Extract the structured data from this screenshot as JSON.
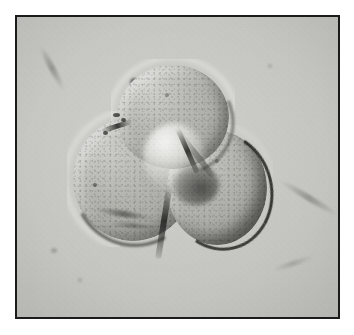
{
  "page": {
    "background_color": "#ffffff",
    "width": 354,
    "height": 335,
    "content_type": "photomicrograph"
  },
  "plate": {
    "frame_color": "#1b1b1b",
    "frame_width_px": 2,
    "left_px": 15,
    "top_px": 15,
    "width_px": 325,
    "height_px": 304,
    "field_background_color": "#c8c8c4"
  },
  "micrograph": {
    "modality": "differential-interference-contrast",
    "illumination_direction": "upper-left",
    "color_mode": "grayscale",
    "background_tone": "#c8c8c4",
    "specimen_label": "trilobate-foraminifera-test",
    "chambers": [
      {
        "id": "chamber-top",
        "name": "dorsal-chamber",
        "position": "top-center",
        "highlight_color": "#d2d2ce",
        "shadow_color": "#8e8e8a"
      },
      {
        "id": "chamber-left",
        "name": "ventral-chamber",
        "position": "left",
        "highlight_color": "#cdcdc9",
        "shadow_color": "#8d8d89"
      },
      {
        "id": "chamber-right",
        "name": "final-chamber",
        "position": "lower-right",
        "highlight_color": "#c8c8c4",
        "shadow_color": "#868682"
      }
    ],
    "features": [
      {
        "id": "umbilicus",
        "name": "umbilical-boss",
        "tone": "bright"
      },
      {
        "id": "aperture-shadow",
        "name": "aperture",
        "tone": "dark"
      },
      {
        "id": "suture-a",
        "name": "suture-top-right",
        "tone": "dark"
      },
      {
        "id": "suture-b",
        "name": "suture-top-left",
        "tone": "dark"
      },
      {
        "id": "suture-c",
        "name": "suture-left-right",
        "tone": "dark"
      }
    ],
    "background_debris": [
      {
        "id": "debris-1",
        "x": 115,
        "y": 63,
        "size": 7
      },
      {
        "id": "debris-2",
        "x": 143,
        "y": 74,
        "size": 4
      },
      {
        "id": "debris-3",
        "x": 228,
        "y": 206,
        "size": 6
      },
      {
        "id": "debris-4",
        "x": 36,
        "y": 233,
        "size": 5
      },
      {
        "id": "debris-5",
        "x": 252,
        "y": 48,
        "size": 3
      },
      {
        "id": "debris-6",
        "x": 62,
        "y": 262,
        "size": 3
      }
    ],
    "background_streaks": [
      {
        "id": "streak-1",
        "x": 14,
        "y": 52,
        "width": 46,
        "height": 5,
        "rotation": 62
      },
      {
        "id": "streak-2",
        "x": 262,
        "y": 182,
        "width": 64,
        "height": 5,
        "rotation": 31
      },
      {
        "id": "streak-3",
        "x": 258,
        "y": 246,
        "width": 40,
        "height": 4,
        "rotation": -18
      }
    ]
  }
}
